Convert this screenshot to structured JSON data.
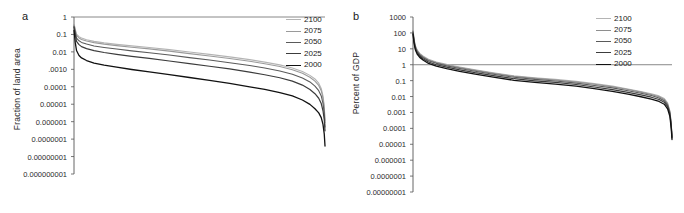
{
  "figure": {
    "panel_a_letter": "a",
    "panel_b_letter": "b"
  },
  "chart_data": [
    {
      "id": "panel-a",
      "type": "line",
      "title": "a",
      "xlabel": "",
      "ylabel": "Fraction of land area",
      "yscale": "log",
      "ylim": [
        1e-09,
        1
      ],
      "ytick_labels": [
        "1",
        "0.1",
        "0.01",
        ".0010",
        "0.0001",
        "0.00001",
        "0.000001",
        "0.0000001",
        "0.00000001",
        "0.000000001"
      ],
      "ytick_values": [
        1,
        0.1,
        0.01,
        0.001,
        0.0001,
        1e-05,
        1e-06,
        1e-07,
        1e-08,
        1e-09
      ],
      "xtick_labels": [],
      "grid": false,
      "legend_position": "top-right",
      "x_description": "Countries ranked in descending order of impacted fraction of land area",
      "series": [
        {
          "name": "2100",
          "color": "#b4b4b4",
          "width": 1.1,
          "x": [
            0,
            0.5,
            1,
            2,
            3,
            5,
            8,
            12,
            17,
            23,
            30,
            38,
            46,
            54,
            62,
            70,
            76,
            82,
            87,
            91,
            94,
            96,
            97.5,
            98.5,
            99.2,
            99.7,
            100
          ],
          "y": [
            0.42,
            0.2,
            0.105,
            0.075,
            0.062,
            0.05,
            0.04,
            0.033,
            0.027,
            0.022,
            0.018,
            0.0135,
            0.0098,
            0.0072,
            0.0052,
            0.0036,
            0.0026,
            0.0018,
            0.0012,
            0.00075,
            0.00045,
            0.00028,
            0.00016,
            8e-05,
            3e-05,
            8e-06,
            1.2e-06
          ]
        },
        {
          "name": "2075",
          "color": "#9a9a9a",
          "width": 1.1,
          "x": [
            0,
            0.5,
            1,
            2,
            3,
            5,
            8,
            12,
            17,
            23,
            30,
            38,
            46,
            54,
            62,
            70,
            76,
            82,
            87,
            91,
            94,
            96,
            97.5,
            98.5,
            99.2,
            99.7,
            100
          ],
          "y": [
            0.38,
            0.17,
            0.088,
            0.063,
            0.052,
            0.042,
            0.034,
            0.028,
            0.023,
            0.0185,
            0.0148,
            0.011,
            0.008,
            0.0058,
            0.0042,
            0.0029,
            0.0021,
            0.00145,
            0.00095,
            0.0006,
            0.00035,
            0.00021,
            0.00012,
            6e-05,
            2.2e-05,
            6e-06,
            9e-07
          ]
        },
        {
          "name": "2050",
          "color": "#5a5a5a",
          "width": 1.1,
          "x": [
            0,
            0.5,
            1,
            2,
            3,
            5,
            8,
            12,
            17,
            23,
            30,
            38,
            46,
            54,
            62,
            70,
            76,
            82,
            87,
            91,
            94,
            96,
            97.5,
            98.5,
            99.2,
            99.7,
            100
          ],
          "y": [
            0.3,
            0.13,
            0.062,
            0.043,
            0.035,
            0.028,
            0.022,
            0.018,
            0.0145,
            0.0115,
            0.009,
            0.0066,
            0.0047,
            0.0034,
            0.0024,
            0.00165,
            0.00118,
            0.0008,
            0.00052,
            0.00032,
            0.00019,
            0.00011,
            6e-05,
            3e-05,
            1.1e-05,
            3.2e-06,
            5e-07
          ]
        },
        {
          "name": "2025",
          "color": "#3c3c3c",
          "width": 1.2,
          "x": [
            0,
            0.5,
            1,
            2,
            3,
            5,
            8,
            12,
            17,
            23,
            30,
            38,
            46,
            54,
            62,
            70,
            76,
            82,
            87,
            91,
            94,
            96,
            97.5,
            98.5,
            99.2,
            99.7,
            100
          ],
          "y": [
            0.26,
            0.1,
            0.04,
            0.026,
            0.02,
            0.0155,
            0.0118,
            0.0092,
            0.0072,
            0.0055,
            0.0042,
            0.003,
            0.0021,
            0.0015,
            0.00105,
            0.0007,
            0.00049,
            0.00033,
            0.00021,
            0.000125,
            7e-05,
            4e-05,
            2.2e-05,
            1.1e-05,
            4.2e-06,
            1.3e-06,
            3e-07
          ]
        },
        {
          "name": "2000",
          "color": "#111111",
          "width": 1.3,
          "x": [
            0,
            0.5,
            1,
            2,
            3,
            5,
            8,
            12,
            17,
            23,
            30,
            38,
            46,
            54,
            62,
            70,
            76,
            82,
            87,
            91,
            94,
            96,
            97.5,
            98.5,
            99.2,
            99.7,
            100
          ],
          "y": [
            0.17,
            0.035,
            0.012,
            0.0062,
            0.0045,
            0.0032,
            0.0023,
            0.00175,
            0.00132,
            0.00098,
            0.00072,
            0.0005,
            0.00034,
            0.00023,
            0.000155,
            0.0001,
            7e-05,
            4.6e-05,
            3e-05,
            1.75e-05,
            9.8e-06,
            5.5e-06,
            3.2e-06,
            1.7e-06,
            7e-07,
            2e-07,
            4e-08
          ]
        }
      ],
      "legend": [
        {
          "label": "2100",
          "color": "#b4b4b4"
        },
        {
          "label": "2075",
          "color": "#9a9a9a"
        },
        {
          "label": "2050",
          "color": "#5a5a5a"
        },
        {
          "label": "2025",
          "color": "#3c3c3c"
        },
        {
          "label": "2000",
          "color": "#111111"
        }
      ]
    },
    {
      "id": "panel-b",
      "type": "line",
      "title": "b",
      "xlabel": "",
      "ylabel": "Percent of GDP",
      "yscale": "log",
      "ylim": [
        1e-08,
        1000
      ],
      "ytick_labels": [
        "1000",
        "100",
        "10",
        "1",
        "0.1",
        "0.01",
        "0.001",
        "0.0001",
        "0.00001",
        "0.000001",
        "0.0000001",
        "0.00000001"
      ],
      "ytick_values": [
        1000,
        100,
        10,
        1,
        0.1,
        0.01,
        0.001,
        0.0001,
        1e-05,
        1e-06,
        1e-07,
        1e-08
      ],
      "xtick_labels": [],
      "grid": false,
      "legend_position": "top-right",
      "x_description": "Countries ranked in descending order of impact as percent of GDP",
      "series": [
        {
          "name": "2100",
          "color": "#b4b4b4",
          "width": 1.1,
          "x": [
            0,
            0.4,
            0.9,
            1.6,
            2.6,
            4,
            6,
            9,
            13,
            18,
            24,
            31,
            39,
            47,
            55,
            63,
            70,
            77,
            83,
            88,
            92,
            95,
            97,
            98.3,
            99.2,
            99.7,
            100
          ],
          "y": [
            160,
            42,
            16,
            8.5,
            5.2,
            3.4,
            2.2,
            1.5,
            1.05,
            0.72,
            0.48,
            0.31,
            0.2,
            0.15,
            0.12,
            0.09,
            0.065,
            0.045,
            0.03,
            0.021,
            0.015,
            0.011,
            0.0075,
            0.004,
            0.0012,
            0.00022,
            3.5e-05
          ]
        },
        {
          "name": "2075",
          "color": "#8e8e8e",
          "width": 1.1,
          "x": [
            0,
            0.4,
            0.9,
            1.6,
            2.6,
            4,
            6,
            9,
            13,
            18,
            24,
            31,
            39,
            47,
            55,
            63,
            70,
            77,
            83,
            88,
            92,
            95,
            97,
            98.3,
            99.2,
            99.7,
            100
          ],
          "y": [
            140,
            38,
            14.5,
            7.8,
            4.8,
            3.1,
            2.0,
            1.38,
            0.96,
            0.66,
            0.44,
            0.285,
            0.185,
            0.138,
            0.11,
            0.082,
            0.059,
            0.041,
            0.0275,
            0.019,
            0.0135,
            0.0098,
            0.0066,
            0.0035,
            0.0011,
            0.0002,
            3e-05
          ]
        },
        {
          "name": "2050",
          "color": "#5a5a5a",
          "width": 1.1,
          "x": [
            0,
            0.4,
            0.9,
            1.6,
            2.6,
            4,
            6,
            9,
            13,
            18,
            24,
            31,
            39,
            47,
            55,
            63,
            70,
            77,
            83,
            88,
            92,
            95,
            97,
            98.3,
            99.2,
            99.7,
            100
          ],
          "y": [
            120,
            33,
            12.5,
            6.8,
            4.2,
            2.75,
            1.78,
            1.22,
            0.85,
            0.58,
            0.385,
            0.25,
            0.162,
            0.12,
            0.095,
            0.07,
            0.05,
            0.035,
            0.023,
            0.016,
            0.0115,
            0.0082,
            0.0055,
            0.0029,
            0.00092,
            0.00017,
            2.8e-05
          ]
        },
        {
          "name": "2025",
          "color": "#3c3c3c",
          "width": 1.2,
          "x": [
            0,
            0.4,
            0.9,
            1.6,
            2.6,
            4,
            6,
            9,
            13,
            18,
            24,
            31,
            39,
            47,
            55,
            63,
            70,
            77,
            83,
            88,
            92,
            95,
            97,
            98.3,
            99.2,
            99.7,
            100
          ],
          "y": [
            100,
            28,
            10.5,
            5.7,
            3.5,
            2.3,
            1.48,
            1.0,
            0.7,
            0.48,
            0.315,
            0.205,
            0.132,
            0.098,
            0.077,
            0.057,
            0.04,
            0.027,
            0.0185,
            0.0128,
            0.0091,
            0.0065,
            0.0044,
            0.0023,
            0.00075,
            0.00014,
            2.5e-05
          ]
        },
        {
          "name": "2000",
          "color": "#111111",
          "width": 1.3,
          "x": [
            0,
            0.4,
            0.9,
            1.6,
            2.6,
            4,
            6,
            9,
            13,
            18,
            24,
            31,
            39,
            47,
            55,
            63,
            70,
            77,
            83,
            88,
            92,
            95,
            97,
            98.3,
            99.2,
            99.7,
            100
          ],
          "y": [
            85,
            23,
            8.8,
            4.7,
            2.9,
            1.9,
            1.2,
            0.82,
            0.57,
            0.385,
            0.255,
            0.165,
            0.105,
            0.078,
            0.061,
            0.045,
            0.031,
            0.021,
            0.0142,
            0.0097,
            0.0069,
            0.0049,
            0.0033,
            0.0017,
            0.00055,
            0.0001,
            2e-05
          ]
        }
      ],
      "legend": [
        {
          "label": "2100",
          "color": "#b4b4b4"
        },
        {
          "label": "2075",
          "color": "#8e8e8e"
        },
        {
          "label": "2050",
          "color": "#5a5a5a"
        },
        {
          "label": "2025",
          "color": "#3c3c3c"
        },
        {
          "label": "2000",
          "color": "#111111"
        }
      ]
    }
  ]
}
